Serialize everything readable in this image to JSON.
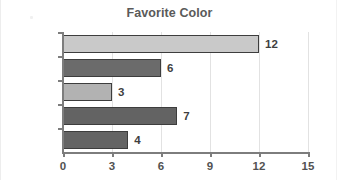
{
  "chart_data": {
    "type": "bar",
    "orientation": "horizontal",
    "title": "Favorite Color",
    "xlabel": "",
    "ylabel": "",
    "categories": [
      "Cyan",
      "Purple",
      "Green",
      "Red",
      "Blue"
    ],
    "values": [
      12,
      6,
      3,
      7,
      4
    ],
    "value_labels": [
      "12",
      "6",
      "3",
      "7",
      "4"
    ],
    "bar_colors": [
      "#c9c9c9",
      "#6b6b6b",
      "#b2b2b2",
      "#636363",
      "#646464"
    ],
    "bar_border_color": "#3d3d3d",
    "xlim": [
      0,
      15
    ],
    "xticks": [
      0,
      3,
      6,
      9,
      12,
      15
    ],
    "xtick_labels": [
      "0",
      "3",
      "6",
      "9",
      "12",
      "15"
    ],
    "grid": true,
    "grid_axis": "x",
    "grid_color": "#e2e2e2",
    "legend": false,
    "axis_color": "#7d7d7d",
    "title_color": "#5a5a5a",
    "label_color": "#4f4f4f",
    "background": "#ffffff"
  }
}
